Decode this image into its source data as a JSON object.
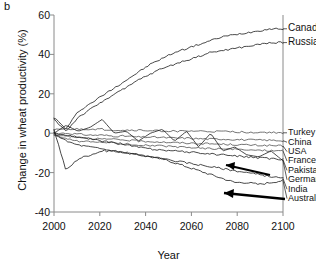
{
  "panel": {
    "label": "b"
  },
  "chart_data": {
    "type": "line",
    "title": "",
    "xlabel": "Year",
    "ylabel": "Change in wheat productivity (%)",
    "xlim": [
      2000,
      2100
    ],
    "ylim": [
      -40,
      60
    ],
    "xticks": [
      2000,
      2020,
      2040,
      2060,
      2080,
      2100
    ],
    "yticks": [
      -40,
      -20,
      0,
      20,
      40,
      60
    ],
    "grid": false,
    "legend_position": "right-outside",
    "x": [
      2000,
      2005,
      2010,
      2015,
      2020,
      2025,
      2030,
      2035,
      2040,
      2045,
      2050,
      2055,
      2060,
      2065,
      2070,
      2075,
      2080,
      2085,
      2090,
      2095
    ],
    "series": [
      {
        "name": "Canada",
        "label": "Canada",
        "values": [
          8,
          2,
          11,
          15,
          19,
          23,
          27,
          31,
          35,
          38,
          41,
          43,
          45,
          47,
          49,
          50,
          51,
          52,
          53,
          53
        ]
      },
      {
        "name": "Russia",
        "label": "Russia",
        "values": [
          7,
          1,
          8,
          12,
          16,
          20,
          23,
          27,
          30,
          33,
          35,
          37,
          39,
          41,
          42,
          43,
          44,
          45,
          46,
          46
        ]
      },
      {
        "name": "Turkey",
        "label": "Turkey",
        "values": [
          2,
          2,
          2,
          2,
          2,
          1.5,
          1.5,
          1.5,
          1.2,
          1.2,
          1,
          1,
          1,
          0.8,
          0.8,
          0.6,
          0.5,
          0.4,
          0.3,
          0.2
        ]
      },
      {
        "name": "China",
        "label": "China",
        "values": [
          0,
          0,
          -0.5,
          -1,
          -1,
          -1.5,
          -1.5,
          -2,
          -2,
          -2.2,
          -2.5,
          -2.5,
          -2.8,
          -3,
          -3,
          -3.2,
          -3.4,
          -3.5,
          -3.6,
          -3.8
        ]
      },
      {
        "name": "USA",
        "label": "USA",
        "values": [
          -1,
          -1.5,
          -2,
          -2.5,
          -3,
          -3.2,
          -3.5,
          -4,
          -4.2,
          -4.5,
          -4.8,
          -5,
          -5.2,
          -5.4,
          -5.6,
          -5.8,
          -6,
          -6.2,
          -6.3,
          -6.5
        ]
      },
      {
        "name": "France",
        "label": "France",
        "values": [
          -1,
          -3,
          -4,
          -4.5,
          -4.5,
          -5,
          -5.5,
          -6,
          -6.2,
          -6.5,
          -7,
          -7.2,
          -7.5,
          -7.8,
          -8,
          -8.2,
          -8.5,
          -8.6,
          -8.8,
          -9
        ]
      },
      {
        "name": "Pakistan",
        "label": "Pakistan",
        "values": [
          0,
          -1,
          -2,
          -3,
          -4,
          -5,
          -6,
          -7,
          -8,
          -8.5,
          -9,
          -9.5,
          -10,
          -10.5,
          -11,
          -11.5,
          -12,
          -12.5,
          -13,
          -13.5
        ]
      },
      {
        "name": "Germany",
        "label": "Germany",
        "values": [
          0,
          4,
          1,
          3,
          7,
          0,
          1,
          -4,
          0,
          2,
          -4,
          1,
          -7,
          0,
          -9,
          -7,
          -11,
          -12,
          -9,
          -14
        ]
      },
      {
        "name": "India",
        "label": "India",
        "values": [
          0,
          -4,
          -6,
          -7,
          -8,
          -9,
          -10,
          -11,
          -12,
          -13,
          -14,
          -15,
          -16,
          -17,
          -18,
          -19,
          -20,
          -21,
          -22,
          -23
        ]
      },
      {
        "name": "Australia",
        "label": "Australia",
        "values": [
          2,
          -19,
          -13,
          -11,
          -9,
          -9,
          -10,
          -11,
          -12,
          -13,
          -15,
          -17,
          -19,
          -21,
          -23,
          -25,
          -25,
          -26,
          -25,
          -24
        ]
      }
    ],
    "annotations": [
      {
        "name": "arrow-to-germany",
        "text": ""
      },
      {
        "name": "arrow-to-australia",
        "text": ""
      }
    ]
  }
}
